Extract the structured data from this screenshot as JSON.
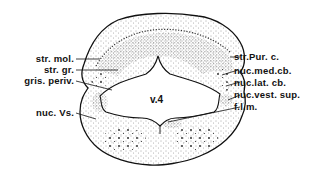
{
  "figure": {
    "type": "anatomical cross-section",
    "center_label": "v.4",
    "labels_left": [
      {
        "id": "str-mol",
        "text": "str. mol."
      },
      {
        "id": "str-gr",
        "text": "str. gr."
      },
      {
        "id": "gris-periv",
        "text": "gris. periv."
      },
      {
        "id": "nuc-vs",
        "text": "nuc. Vs."
      }
    ],
    "labels_right": [
      {
        "id": "str-pur-c",
        "text": "str.Pur. c."
      },
      {
        "id": "nuc-med-cb",
        "text": "nuc.med.cb."
      },
      {
        "id": "nuc-lat-cb",
        "text": "nuc.lat. cb."
      },
      {
        "id": "nuc-vest-sup",
        "text": "nuc.vest. sup."
      },
      {
        "id": "f-l-m",
        "text": "f.l.m."
      }
    ],
    "colors": {
      "ink": "#111111",
      "background": "#ffffff",
      "stipple": "#555555"
    }
  }
}
